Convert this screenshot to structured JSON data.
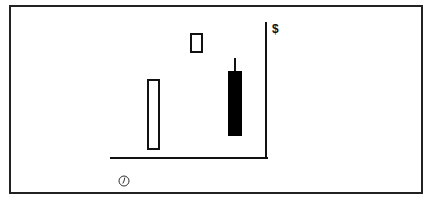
{
  "diagram": {
    "type": "candlestick-illustration",
    "axes": {
      "y_label": "$",
      "x_label_icon": "clock-icon"
    },
    "candles": [
      {
        "name": "candle-1",
        "style": "hollow",
        "body": {
          "x": 147,
          "top": 79,
          "width": 13,
          "height": 71
        }
      },
      {
        "name": "candle-2",
        "style": "hollow",
        "body": {
          "x": 190,
          "top": 33,
          "width": 13,
          "height": 20
        }
      },
      {
        "name": "candle-3",
        "style": "filled",
        "body": {
          "x": 228,
          "top": 71,
          "width": 14,
          "height": 65
        },
        "upper_wick": {
          "x": 234,
          "top": 58,
          "height": 13
        }
      }
    ],
    "colors": {
      "line": "#111111",
      "filled_body": "#000000",
      "hollow_body": "#ffffff",
      "background": "#ffffff"
    }
  }
}
